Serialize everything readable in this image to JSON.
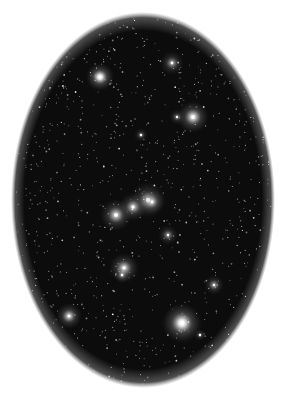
{
  "image": {
    "description": "Star cluster field within an oval vignette on white background",
    "background": "#ffffff",
    "oval": {
      "cx": 143,
      "cy": 200,
      "rx": 130,
      "ry": 186,
      "color": "#0d0d0d"
    },
    "bright_stars": [
      {
        "x": 100,
        "y": 77,
        "r": 14,
        "intensity": 1.0
      },
      {
        "x": 172,
        "y": 63,
        "r": 12,
        "intensity": 0.55
      },
      {
        "x": 193,
        "y": 117,
        "r": 16,
        "intensity": 0.85
      },
      {
        "x": 177,
        "y": 117,
        "r": 8,
        "intensity": 0.4
      },
      {
        "x": 141,
        "y": 135,
        "r": 7,
        "intensity": 0.4
      },
      {
        "x": 148,
        "y": 200,
        "r": 18,
        "intensity": 0.6
      },
      {
        "x": 116,
        "y": 215,
        "r": 16,
        "intensity": 0.75
      },
      {
        "x": 133,
        "y": 207,
        "r": 14,
        "intensity": 0.7
      },
      {
        "x": 152,
        "y": 202,
        "r": 12,
        "intensity": 0.6
      },
      {
        "x": 168,
        "y": 235,
        "r": 10,
        "intensity": 0.5
      },
      {
        "x": 124,
        "y": 268,
        "r": 15,
        "intensity": 0.75
      },
      {
        "x": 122,
        "y": 275,
        "r": 8,
        "intensity": 0.5
      },
      {
        "x": 214,
        "y": 285,
        "r": 10,
        "intensity": 0.55
      },
      {
        "x": 69,
        "y": 316,
        "r": 13,
        "intensity": 0.75
      },
      {
        "x": 182,
        "y": 323,
        "r": 20,
        "intensity": 1.0
      },
      {
        "x": 200,
        "y": 335,
        "r": 6,
        "intensity": 0.4
      }
    ],
    "faint_star_count": 900,
    "seed": 7
  }
}
